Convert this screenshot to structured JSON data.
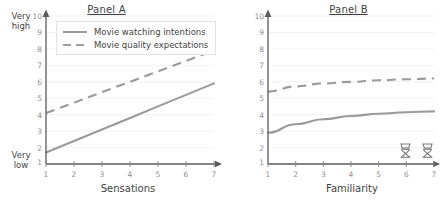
{
  "figure": {
    "background": "#ffffff",
    "line_color": "#9a9a9a",
    "text_color": "#3f3f3f",
    "tick_color": "#8f8f8f",
    "grid_color": "#f0f0f0"
  },
  "legend": {
    "items": [
      {
        "label": "Movie watching intentions",
        "style": "solid",
        "icon": "solid-line-swatch"
      },
      {
        "label": "Movie quality expectations",
        "style": "dashed",
        "icon": "dashed-line-swatch"
      }
    ]
  },
  "panel_a": {
    "title": "Panel A",
    "xlabel": "Sensations",
    "y_top_label": "Very high",
    "y_bottom_label": "Very low",
    "yticks": [
      "10",
      "9",
      "8",
      "7",
      "6",
      "5",
      "4",
      "3",
      "2",
      "1"
    ],
    "xticks": [
      "1",
      "2",
      "3",
      "4",
      "5",
      "6",
      "7"
    ]
  },
  "panel_b": {
    "title": "Panel B",
    "xlabel": "Familiarity",
    "yticks": [
      "10",
      "9",
      "8",
      "7",
      "6",
      "5",
      "4",
      "3",
      "2",
      "1"
    ],
    "xticks": [
      "1",
      "2",
      "3",
      "4",
      "5",
      "6",
      "7"
    ],
    "markers": [
      {
        "icon": "film-reel-icon",
        "x": 6
      },
      {
        "icon": "film-reel-icon",
        "x": 7
      }
    ]
  },
  "chart_data": [
    {
      "type": "line",
      "title": "Panel A",
      "xlabel": "Sensations",
      "ylabel": "",
      "y_top_label": "Very high",
      "y_bottom_label": "Very low",
      "xlim": [
        1,
        7
      ],
      "ylim": [
        1,
        10
      ],
      "xticks": [
        1,
        2,
        3,
        4,
        5,
        6,
        7
      ],
      "yticks": [
        1,
        2,
        3,
        4,
        5,
        6,
        7,
        8,
        9,
        10
      ],
      "grid": "horizontal",
      "legend_position": "top-left",
      "x": [
        1,
        2,
        3,
        4,
        5,
        6,
        7
      ],
      "series": [
        {
          "name": "Movie watching intentions",
          "style": "solid",
          "values": [
            1.7,
            2.4,
            3.1,
            3.8,
            4.5,
            5.2,
            5.9
          ]
        },
        {
          "name": "Movie quality expectations",
          "style": "dashed",
          "values": [
            4.1,
            4.73,
            5.37,
            6.0,
            6.63,
            7.27,
            7.9
          ]
        }
      ]
    },
    {
      "type": "line",
      "title": "Panel B",
      "xlabel": "Familiarity",
      "ylabel": "",
      "xlim": [
        1,
        7
      ],
      "ylim": [
        1,
        10
      ],
      "xticks": [
        1,
        2,
        3,
        4,
        5,
        6,
        7
      ],
      "yticks": [
        1,
        2,
        3,
        4,
        5,
        6,
        7,
        8,
        9,
        10
      ],
      "grid": "horizontal",
      "legend_position": "none",
      "x": [
        1,
        2,
        3,
        4,
        5,
        6,
        7
      ],
      "series": [
        {
          "name": "Movie watching intentions",
          "style": "solid",
          "values": [
            2.9,
            3.42,
            3.72,
            3.92,
            4.05,
            4.15,
            4.2
          ]
        },
        {
          "name": "Movie quality expectations",
          "style": "dashed",
          "values": [
            5.4,
            5.72,
            5.9,
            6.0,
            6.09,
            6.15,
            6.2
          ]
        }
      ],
      "annotations": [
        {
          "icon": "film-reel-icon",
          "x": 6,
          "y": 1
        },
        {
          "icon": "film-reel-icon",
          "x": 7,
          "y": 1
        }
      ]
    }
  ]
}
